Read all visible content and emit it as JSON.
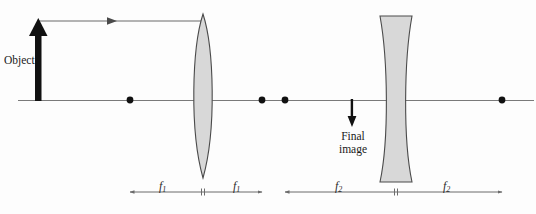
{
  "figure": {
    "type": "optics-ray-diagram",
    "background_color": "#fdfdfd",
    "line_color": "#6b6b6b",
    "dark_color": "#111111",
    "lens_fill": "#d8d8d8",
    "lens_stroke": "#4a4a4a",
    "text_color": "#1a1a1a"
  },
  "labels": {
    "object": "Object",
    "final_image_line1": "Final",
    "final_image_line2": "image",
    "f1_left": "f",
    "f1_left_sub": "1",
    "f1_right": "f",
    "f1_right_sub": "1",
    "f2_left": "f",
    "f2_left_sub": "2",
    "f2_right": "f",
    "f2_right_sub": "2"
  },
  "geometry": {
    "optical_axis": {
      "x1": 18,
      "y": 100,
      "x2": 534
    },
    "object_arrow": {
      "x": 38,
      "y_base": 101,
      "y_tip": 20
    },
    "incident_ray": {
      "x1": 38,
      "y": 21,
      "x2": 204,
      "arrow_x": 113
    },
    "converging_lens": {
      "cx": 203,
      "top": 14,
      "bottom": 178,
      "half_width": 13
    },
    "diverging_lens": {
      "cx": 396,
      "top": 16,
      "bottom": 182,
      "outer_half": 16,
      "waist_half": 5
    },
    "final_image_arrow": {
      "x": 352,
      "y_base": 100,
      "y_tip": 126
    },
    "focal_dots": [
      {
        "x": 130,
        "y": 100
      },
      {
        "x": 262,
        "y": 100
      },
      {
        "x": 285,
        "y": 100
      },
      {
        "x": 502,
        "y": 100
      }
    ],
    "f1_bar": {
      "x1": 130,
      "x2": 262,
      "center": 203,
      "y": 192
    },
    "f2_bar": {
      "x1": 285,
      "x2": 502,
      "center": 396,
      "y": 192
    }
  }
}
